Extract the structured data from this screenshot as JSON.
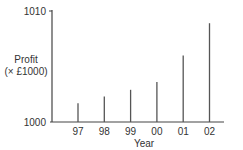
{
  "chart_data": {
    "type": "bar",
    "style": "vertical-line-bars",
    "title": "",
    "xlabel": "Year",
    "ylabel": "Profit",
    "ylabel_sub": "(× £1000)",
    "categories": [
      "97",
      "98",
      "99",
      "00",
      "01",
      "02"
    ],
    "values": [
      1001.7,
      1002.3,
      1002.9,
      1003.6,
      1006.0,
      1008.9
    ],
    "ylim": [
      1000,
      1010
    ],
    "yticks": [
      "1000",
      "1010"
    ],
    "grid": false,
    "legend": null,
    "colors": {
      "axis": "#444444",
      "bar": "#555555",
      "text": "#333333"
    }
  }
}
